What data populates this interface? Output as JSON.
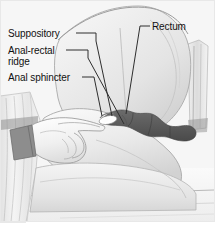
{
  "figure": {
    "type": "medical-illustration",
    "style": "grayscale line drawing",
    "width": 221,
    "height": 229
  },
  "labels": {
    "suppository": "Suppository",
    "anal_rectal_ridge_line1": "Anal-rectal",
    "anal_rectal_ridge_line2": "ridge",
    "anal_sphincter": "Anal sphincter",
    "rectum": "Rectum"
  },
  "colors": {
    "background": "#ffffff",
    "skin_light": "#f2f2f2",
    "skin_mid": "#e2e2e2",
    "skin_shade": "#cfcfcf",
    "drape": "#ebebeb",
    "rectum_dark": "#595959",
    "glove": "#fafafa",
    "cuff_dark": "#6e6e6e",
    "outline": "#8a8a8a",
    "leader_line": "#3a3a3a",
    "text": "#111111"
  },
  "leader_lines": {
    "suppository": "from label right edge to suppository tip at anal canal",
    "anal_rectal_ridge": "from label right edge to rectal ridge",
    "anal_sphincter": "from label right edge to sphincter region",
    "rectum": "from label left edge down to rectal lumen"
  },
  "anatomy": {
    "rectal_canal": "dark lobed channel running to the right",
    "suppository_object": "small white capsule at fingertip",
    "gloved_hand": "gloved hand with extended index finger inserting suppository",
    "buttock": "curved buttock contour",
    "thigh": "lower leg resting on bed",
    "bed_linen": "horizontal sheet lines across lower area",
    "drapery_left": "vertical folded drape at left edge",
    "drapery_right": "vertical folded drape at right edge"
  }
}
